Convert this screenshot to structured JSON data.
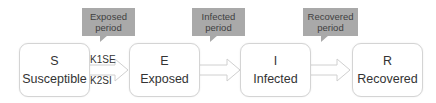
{
  "nodes": [
    {
      "letter": "S",
      "name": "Susceptible"
    },
    {
      "letter": "E",
      "name": "Exposed"
    },
    {
      "letter": "I",
      "name": "Infected"
    },
    {
      "letter": "R",
      "name": "Recovered"
    }
  ],
  "callouts": [
    {
      "line1": "Exposed",
      "line2": "period"
    },
    {
      "line1": "Infected",
      "line2": "period"
    },
    {
      "line1": "Recovered",
      "line2": "period"
    }
  ],
  "rates": {
    "k1": "K1SE",
    "k2": "K2SI"
  },
  "colors": {
    "callout": "#a9a9a9",
    "border": "#d4d4d4"
  }
}
